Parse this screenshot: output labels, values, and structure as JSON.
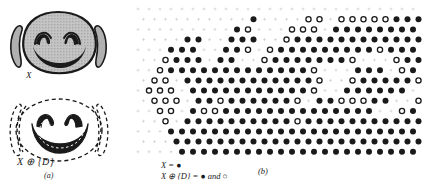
{
  "figure": {
    "panels": [
      {
        "id": "a",
        "caption": "(a)",
        "labels": {
          "original": "X",
          "dilated": "X ⊕ {D}"
        },
        "description": "Hand-drawn smiley face X (solid gray shaded) above, and its dilation X ⊕ {D} drawn with dashed expanded outlines below."
      },
      {
        "id": "b",
        "caption": "(b)",
        "legend": [
          {
            "text": "X = ",
            "symbol": "●",
            "symbol_name": "filled-dot"
          },
          {
            "text": "X ⊕ {D} = ",
            "symbol": "●",
            "symbol_name": "filled-dot",
            "conjunction": " and ",
            "symbol2": "○",
            "symbol2_name": "open-dot"
          }
        ],
        "description": "Hexagonal lattice sampling of the same smiley face. Filled dots mark X; filled plus open dots mark the dilation X ⊕ {D}."
      }
    ],
    "colors": {
      "ink": "#1a1a1a",
      "face_fill": "#b9b9b9",
      "grid_tick": "#cfcfcf",
      "background": "#ffffff"
    },
    "lattice": {
      "type": "hexagonal",
      "dx": 11.0,
      "dy": 10.2,
      "filled_radius": 3.0,
      "open_radius": 3.0,
      "origin_x": 8.0,
      "origin_y": 9.0,
      "cols": 26,
      "rows": 15,
      "rows_data": [
        "...........................",
        "..........F....OO.OOOOOFFF.",
        ".........FO...OOO.FFFFFFFF.",
        "....FF..FFF..OFFFFFFFFFFFFF",
        "...FFF..FFO.OFFFFFFFFFOFFFF",
        "..OFFF.FF..OFFFFFFFO...OFFF",
        "..OFFFFFFFFFFFFFO...FFF.OFF",
        ".OO.FFFFFFFFFFFFO..OFFFFFOF",
        ".OOO.FFFFFFFFFFFO..FFFFFF.O",
        ".OOO.FFOFFFFFFO.FFOOOFF..OF",
        "..OO.FOOFFFFFFFFFFFFFF..OFF",
        "..O.FFFFFFFFFFOFFFFFFFFFFFF",
        "...FFFFFFFFFFFFFFFFFFFFFFF.",
        "...FFFFFFFFFFFFFFFFFFFFFFF.",
        "....FFFFFFFFFFFFFFFFFFFFFF."
      ]
    }
  }
}
